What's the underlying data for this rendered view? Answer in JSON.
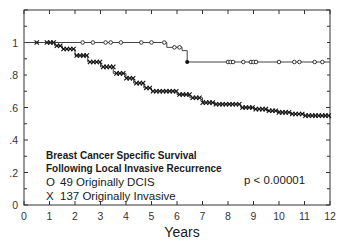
{
  "chart_data": {
    "type": "line",
    "subtype": "kaplan-meier step",
    "title": "Breast Cancer Specific Survival Following Local Invasive Recurrence",
    "xlabel": "Years",
    "ylabel": "",
    "xlim": [
      0,
      12
    ],
    "ylim": [
      0,
      1.2
    ],
    "x_ticks": [
      "0",
      "1",
      "2",
      "3",
      "4",
      "5",
      "6",
      "7",
      "8",
      "9",
      "10",
      "11",
      "12"
    ],
    "y_ticks": [
      "0",
      ".2",
      ".4",
      ".6",
      ".8",
      "1"
    ],
    "grid": false,
    "legend_position": "lower-left inside",
    "series": [
      {
        "name": "49 Originally DCIS",
        "marker": "O",
        "x": [
          0,
          5.4,
          5.6,
          6.2,
          6.4,
          12
        ],
        "y": [
          1.0,
          1.0,
          0.97,
          0.95,
          0.88,
          0.88
        ],
        "censor_marks": [
          2.3,
          2.7,
          3.2,
          3.4,
          3.8,
          4.6,
          5.0,
          5.5,
          5.9,
          6.1,
          8.0,
          8.1,
          8.2,
          8.6,
          8.9,
          9.0,
          9.1,
          10.0,
          10.6,
          10.8,
          11.4,
          11.7
        ]
      },
      {
        "name": "137 Originally Invasive",
        "marker": "X",
        "x": [
          0,
          0.9,
          1.2,
          1.5,
          2.0,
          2.5,
          3.0,
          3.5,
          4.0,
          4.3,
          4.7,
          5.0,
          5.6,
          6.0,
          6.5,
          7.0,
          7.5,
          8.0,
          8.5,
          9.0,
          9.5,
          10.0,
          10.5,
          11.0,
          11.5,
          12.0
        ],
        "y": [
          1.0,
          1.0,
          0.98,
          0.96,
          0.92,
          0.88,
          0.85,
          0.81,
          0.78,
          0.75,
          0.72,
          0.7,
          0.7,
          0.68,
          0.66,
          0.63,
          0.62,
          0.62,
          0.6,
          0.59,
          0.58,
          0.57,
          0.56,
          0.55,
          0.55,
          0.53
        ]
      }
    ],
    "annotations": [
      "p < 0.00001"
    ]
  },
  "legend": {
    "title_line1": "Breast Cancer Specific Survival",
    "title_line2": "Following Local Invasive Recurrence",
    "entries": [
      {
        "marker": "O",
        "label": "49 Originally DCIS"
      },
      {
        "marker": "X",
        "label": "137 Originally Invasive"
      }
    ]
  },
  "annotation": "p < 0.00001",
  "axis": {
    "xlabel": "Years"
  },
  "colors": {
    "line": "#444444",
    "axis": "#333333",
    "text": "#1a1a1a"
  }
}
